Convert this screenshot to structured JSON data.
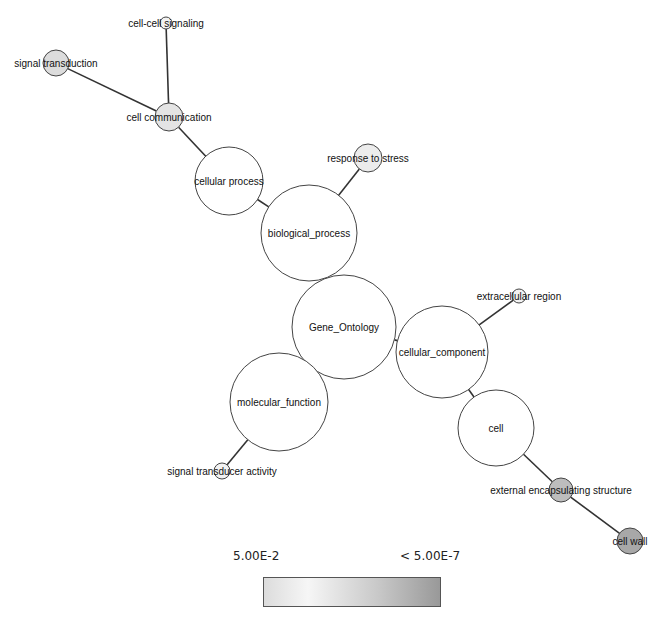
{
  "graph": {
    "nodes": [
      {
        "id": "gene_ontology",
        "label": "Gene_Ontology",
        "x": 344,
        "y": 327,
        "r": 52,
        "fill": "#ffffff"
      },
      {
        "id": "biological_process",
        "label": "biological_process",
        "x": 309,
        "y": 233,
        "r": 48,
        "fill": "#ffffff"
      },
      {
        "id": "cellular_component",
        "label": "cellular_component",
        "x": 442,
        "y": 352,
        "r": 46,
        "fill": "#ffffff"
      },
      {
        "id": "molecular_function",
        "label": "molecular_function",
        "x": 279,
        "y": 402,
        "r": 49,
        "fill": "#ffffff"
      },
      {
        "id": "cellular_process",
        "label": "cellular process",
        "x": 229,
        "y": 181,
        "r": 34,
        "fill": "#ffffff"
      },
      {
        "id": "cell_communication",
        "label": "cell communication",
        "x": 169,
        "y": 117,
        "r": 14,
        "fill": "#e4e4e4"
      },
      {
        "id": "signal_transduction",
        "label": "signal transduction",
        "x": 56,
        "y": 63,
        "r": 13,
        "fill": "#dcdcdc"
      },
      {
        "id": "cell_cell_signaling",
        "label": "cell-cell signaling",
        "x": 166,
        "y": 23,
        "r": 6,
        "fill": "#f2f2f2"
      },
      {
        "id": "response_to_stress",
        "label": "response to stress",
        "x": 368,
        "y": 158,
        "r": 14,
        "fill": "#ececec"
      },
      {
        "id": "extracellular_region",
        "label": "extracellular region",
        "x": 519,
        "y": 296,
        "r": 7,
        "fill": "#f2f2f2"
      },
      {
        "id": "cell",
        "label": "cell",
        "x": 496,
        "y": 428,
        "r": 38,
        "fill": "#ffffff"
      },
      {
        "id": "external_encapsulating_structure",
        "label": "external encapsulating structure",
        "x": 561,
        "y": 490,
        "r": 12,
        "fill": "#bdbdbd"
      },
      {
        "id": "cell_wall",
        "label": "cell wall",
        "x": 630,
        "y": 541,
        "r": 13,
        "fill": "#a8a8a8"
      },
      {
        "id": "signal_transducer_activity",
        "label": "signal transducer activity",
        "x": 222,
        "y": 471,
        "r": 8,
        "fill": "#f2f2f2"
      }
    ],
    "edges": [
      {
        "from": "gene_ontology",
        "to": "biological_process"
      },
      {
        "from": "gene_ontology",
        "to": "cellular_component"
      },
      {
        "from": "gene_ontology",
        "to": "molecular_function"
      },
      {
        "from": "biological_process",
        "to": "cellular_process"
      },
      {
        "from": "biological_process",
        "to": "response_to_stress"
      },
      {
        "from": "cellular_process",
        "to": "cell_communication"
      },
      {
        "from": "cell_communication",
        "to": "signal_transduction"
      },
      {
        "from": "cell_communication",
        "to": "cell_cell_signaling"
      },
      {
        "from": "cellular_component",
        "to": "extracellular_region"
      },
      {
        "from": "cellular_component",
        "to": "cell"
      },
      {
        "from": "cell",
        "to": "external_encapsulating_structure"
      },
      {
        "from": "external_encapsulating_structure",
        "to": "cell_wall"
      },
      {
        "from": "molecular_function",
        "to": "signal_transducer_activity"
      }
    ]
  },
  "legend": {
    "min_label": "5.00E-2",
    "max_label": "< 5.00E-7",
    "gradient_colors": [
      "#dcdcdc",
      "#f6f6f6",
      "#c8c8c8",
      "#999999"
    ]
  }
}
